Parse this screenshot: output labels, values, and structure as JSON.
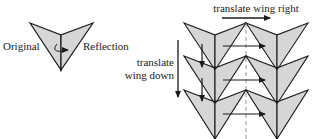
{
  "labels": {
    "original": "Original",
    "reflection": "Reflection",
    "translate_right": "translate wing right",
    "translate_down_line1": "translate",
    "translate_down_line2": "wing down"
  },
  "colors": {
    "fill": "#d6d6d6",
    "stroke": "#1a1a1a",
    "dashed": "#888888",
    "background": "#ffffff"
  },
  "figure": {
    "left": {
      "description": "single wing with its mirror reflection about a vertical axis",
      "rotation_arrow": "curved-reflection-arrow"
    },
    "right": {
      "rows": 3,
      "columns": 2,
      "description": "tessellation from translating reflected wing pairs right and down"
    }
  }
}
